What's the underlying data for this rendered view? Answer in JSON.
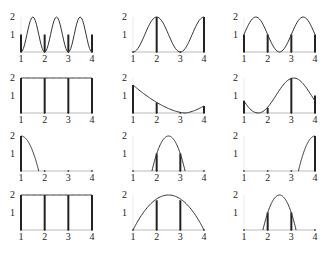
{
  "figure": {
    "rows": 4,
    "cols": 3,
    "x_ticks": [
      "1",
      "2",
      "3",
      "4"
    ],
    "y_ticks": [
      "1",
      "2"
    ],
    "colors": {
      "curve": "#333333",
      "axis": "#bbbbbb",
      "bar": "#222222"
    }
  },
  "chart_data": [
    {
      "type": "line",
      "panel": "r1c1",
      "title": "",
      "xlim": [
        1,
        4
      ],
      "ylim": [
        0,
        2
      ],
      "curve": {
        "shape": "cos",
        "desc": "1+cos(2pi(x-2.5)/1) style: peaks at 2.5 (2), troughs ~1.5 & 3.5 (0), value 1 at 1,2,3,4"
      },
      "bars": [
        {
          "x": 1,
          "h": 1
        },
        {
          "x": 2,
          "h": 1
        },
        {
          "x": 3,
          "h": 1
        },
        {
          "x": 4,
          "h": 1
        }
      ]
    },
    {
      "type": "line",
      "panel": "r1c2",
      "xlim": [
        1,
        4
      ],
      "ylim": [
        0,
        2
      ],
      "curve": {
        "desc": "1-cos(pi(x-1)): 0 at 1, 2 at 2, 0 at 3, 2 at 4"
      },
      "bars": [
        {
          "x": 1,
          "h": 0
        },
        {
          "x": 2,
          "h": 2
        },
        {
          "x": 3,
          "h": 0
        },
        {
          "x": 4,
          "h": 2
        }
      ]
    },
    {
      "type": "line",
      "panel": "r1c3",
      "xlim": [
        1,
        4
      ],
      "ylim": [
        0,
        2
      ],
      "curve": {
        "desc": "peaks 2 at 1.5 and 3.5, trough 0 at 2.5, value 1 at 1,2,3,4"
      },
      "bars": [
        {
          "x": 1,
          "h": 1
        },
        {
          "x": 2,
          "h": 1
        },
        {
          "x": 3,
          "h": 1
        },
        {
          "x": 4,
          "h": 1
        }
      ]
    },
    {
      "type": "line",
      "panel": "r2c1",
      "xlim": [
        1,
        4
      ],
      "ylim": [
        0,
        2
      ],
      "curve": {
        "desc": "constant 2"
      },
      "bars": [
        {
          "x": 1,
          "h": 2
        },
        {
          "x": 2,
          "h": 2
        },
        {
          "x": 3,
          "h": 2
        },
        {
          "x": 4,
          "h": 2
        }
      ]
    },
    {
      "type": "line",
      "panel": "r2c2",
      "xlim": [
        1,
        4
      ],
      "ylim": [
        0,
        2
      ],
      "curve": {
        "desc": "decreasing from 1.6 at 1 to 0 at ~3.2, up to 0.4 at 4"
      },
      "bars": [
        {
          "x": 1,
          "h": 1.6
        },
        {
          "x": 2,
          "h": 0.6
        },
        {
          "x": 3,
          "h": 0
        },
        {
          "x": 4,
          "h": 0.4
        }
      ]
    },
    {
      "type": "line",
      "panel": "r2c3",
      "xlim": [
        1,
        4
      ],
      "ylim": [
        0,
        2
      ],
      "curve": {
        "desc": "0.7 at 1, min 0 at 1.6, 0.3 at 2, max 2 at ~3.1, 1 at 4"
      },
      "bars": [
        {
          "x": 1,
          "h": 0.7
        },
        {
          "x": 2,
          "h": 0.3
        },
        {
          "x": 3,
          "h": 2
        },
        {
          "x": 4,
          "h": 1
        }
      ]
    },
    {
      "type": "line",
      "panel": "r3c1",
      "xlim": [
        1,
        4
      ],
      "ylim": [
        0,
        2
      ],
      "curve": {
        "desc": "2 at 1 falling to 0 at ~1.75"
      },
      "bars": [
        {
          "x": 1,
          "h": 2
        },
        {
          "x": 2,
          "h": 0
        },
        {
          "x": 3,
          "h": 0
        },
        {
          "x": 4,
          "h": 0
        }
      ]
    },
    {
      "type": "line",
      "panel": "r3c2",
      "xlim": [
        1,
        4
      ],
      "ylim": [
        0,
        2
      ],
      "curve": {
        "desc": "arch from 1.8 to 3.2, peak 2 at 2.5"
      },
      "bars": [
        {
          "x": 2,
          "h": 1
        },
        {
          "x": 3,
          "h": 1
        }
      ]
    },
    {
      "type": "line",
      "panel": "r3c3",
      "xlim": [
        1,
        4
      ],
      "ylim": [
        0,
        2
      ],
      "curve": {
        "desc": "rises from 0 at ~3.3 to 2 at 4"
      },
      "bars": [
        {
          "x": 4,
          "h": 2
        }
      ]
    },
    {
      "type": "line",
      "panel": "r4c1",
      "xlim": [
        1,
        4
      ],
      "ylim": [
        0,
        2
      ],
      "curve": {
        "desc": "constant 2"
      },
      "bars": [
        {
          "x": 1,
          "h": 2
        },
        {
          "x": 2,
          "h": 2
        },
        {
          "x": 3,
          "h": 2
        },
        {
          "x": 4,
          "h": 2
        }
      ]
    },
    {
      "type": "line",
      "panel": "r4c2",
      "xlim": [
        1,
        4
      ],
      "ylim": [
        0,
        2
      ],
      "curve": {
        "desc": "arch 0 at 1 and 4, peak 2 at 2.5"
      },
      "bars": [
        {
          "x": 2,
          "h": 1.7
        },
        {
          "x": 3,
          "h": 1.7
        }
      ]
    },
    {
      "type": "line",
      "panel": "r4c3",
      "xlim": [
        1,
        4
      ],
      "ylim": [
        0,
        2
      ],
      "curve": {
        "desc": "arch from 1.8 to 3.2, peak 2 at 2.5"
      },
      "bars": [
        {
          "x": 2,
          "h": 1
        },
        {
          "x": 3,
          "h": 1
        }
      ]
    }
  ]
}
